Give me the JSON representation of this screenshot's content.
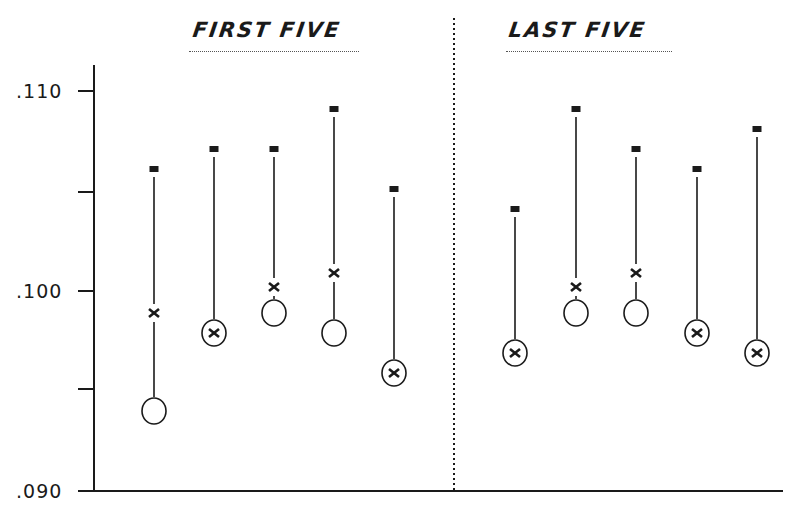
{
  "chart_data": {
    "type": "scatter",
    "subtype": "range-plot (max marker, mean x, circle value) with vertical connecting lines",
    "panels": [
      {
        "title": "FIRST FIVE",
        "columns": [
          1,
          2,
          3,
          4,
          5
        ]
      },
      {
        "title": "LAST FIVE",
        "columns": [
          6,
          7,
          8,
          9,
          10
        ]
      }
    ],
    "xlabel": "",
    "ylabel": "",
    "ylim": [
      0.09,
      0.1115
    ],
    "yticks": [
      0.09,
      0.095,
      0.1,
      0.105,
      0.11
    ],
    "ytick_labels": [
      ".090",
      "",
      ".100",
      "",
      ".110"
    ],
    "grid": false,
    "legend": null,
    "series": [
      {
        "name": "square (high)",
        "marker": "filled-square",
        "values": [
          0.1061,
          0.1071,
          0.1071,
          0.1091,
          0.1051,
          0.1041,
          0.1091,
          0.1071,
          0.1061,
          0.1081
        ]
      },
      {
        "name": "x (mean)",
        "marker": "x",
        "values": [
          0.0989,
          0.0979,
          0.1002,
          0.1009,
          0.0959,
          0.0969,
          0.1002,
          0.1009,
          0.0979,
          0.0969
        ]
      },
      {
        "name": "circle (low)",
        "marker": "open-circle",
        "values": [
          0.094,
          0.0979,
          0.0989,
          0.0979,
          0.0959,
          0.0969,
          0.0989,
          0.0989,
          0.0979,
          0.0969
        ]
      }
    ],
    "categories": [
      "1",
      "2",
      "3",
      "4",
      "5",
      "6",
      "7",
      "8",
      "9",
      "10"
    ]
  },
  "titles": {
    "left": "FIRST FIVE",
    "right": "LAST FIVE"
  },
  "axis": {
    "labels": {
      "t110": ".110",
      "t100": ".100",
      "t090": ".090"
    }
  },
  "layout": {
    "x_positions": [
      154,
      214,
      274,
      334,
      394,
      515,
      576,
      636,
      697,
      757
    ],
    "y_axis_x": 94,
    "y_top_px": 91,
    "y_top_val": 0.11,
    "y_bottom_px": 491,
    "y_bottom_val": 0.09,
    "divider_x": 454,
    "color": "#1a1a1a"
  }
}
